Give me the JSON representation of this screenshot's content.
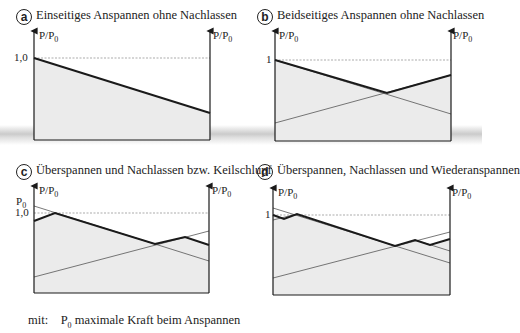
{
  "panels": [
    {
      "id": "a",
      "badge": "a",
      "title": "Einseitiges Anspannen ohne Nachlassen",
      "left_axis_label": "P/P",
      "left_axis_sub": "0",
      "right_axis_label": "P/P",
      "right_axis_sub": "0",
      "ref_tick": "1,0"
    },
    {
      "id": "b",
      "badge": "b",
      "title": "Beidseitiges Anspannen ohne Nachlassen",
      "left_axis_label": "P/P",
      "left_axis_sub": "0",
      "right_axis_label": "P/P",
      "right_axis_sub": "0",
      "ref_tick": "1"
    },
    {
      "id": "c",
      "badge": "c",
      "title": "Überspannen und Nachlassen bzw. Keilschlupf",
      "left_axis_label": "P/P",
      "left_axis_sub": "0",
      "right_axis_label": "P/P",
      "right_axis_sub": "0",
      "ref_tick": "1,0",
      "extra_label": "P",
      "extra_sub": "0"
    },
    {
      "id": "d",
      "badge": "d",
      "title": "Überspannen, Nachlassen und Wiederanspannen",
      "left_axis_label": "P/P",
      "left_axis_sub": "0",
      "right_axis_label": "P/P",
      "right_axis_sub": "0",
      "ref_tick": "1"
    }
  ],
  "footnote": {
    "prefix": "mit:",
    "symbol": "P",
    "symbol_sub": "0",
    "text": "maximale Kraft beim Anspannen"
  },
  "colors": {
    "fill": "#ebebeb",
    "line": "#1a1a1a",
    "thin": "#555555",
    "ref": "#777777"
  }
}
